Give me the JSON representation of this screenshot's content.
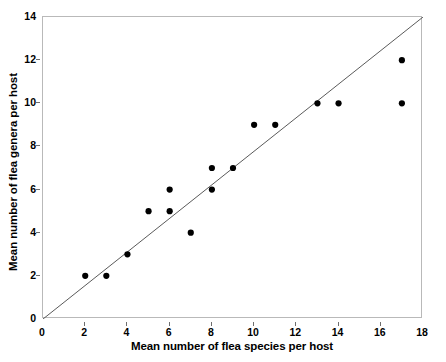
{
  "chart_data": {
    "type": "scatter",
    "title": "",
    "xlabel": "Mean number of flea species per host",
    "ylabel": "Mean number of flea genera per host",
    "xlim": [
      0,
      18
    ],
    "ylim": [
      0,
      14
    ],
    "xticks": [
      0,
      2,
      4,
      6,
      8,
      10,
      12,
      14,
      16,
      18
    ],
    "yticks": [
      0,
      2,
      4,
      6,
      8,
      10,
      12,
      14
    ],
    "grid": false,
    "legend": null,
    "points": [
      {
        "x": 2,
        "y": 2
      },
      {
        "x": 3,
        "y": 2
      },
      {
        "x": 4,
        "y": 3
      },
      {
        "x": 5,
        "y": 5
      },
      {
        "x": 6,
        "y": 6
      },
      {
        "x": 6,
        "y": 5
      },
      {
        "x": 7,
        "y": 4
      },
      {
        "x": 8,
        "y": 7
      },
      {
        "x": 8,
        "y": 6
      },
      {
        "x": 9,
        "y": 7
      },
      {
        "x": 10,
        "y": 9
      },
      {
        "x": 11,
        "y": 9
      },
      {
        "x": 13,
        "y": 10
      },
      {
        "x": 14,
        "y": 10
      },
      {
        "x": 17,
        "y": 12
      },
      {
        "x": 17,
        "y": 10
      }
    ],
    "reference_line": {
      "name": "diagonal-identity-line",
      "from": {
        "x": 0,
        "y": 0
      },
      "to": {
        "x": 18,
        "y": 14
      }
    },
    "colors": {
      "marker": "#000000",
      "line": "#5a5a5a",
      "frame": "#b9b9b9",
      "text": "#000000",
      "background": "#ffffff"
    },
    "marker_radius_px": 3.1
  }
}
